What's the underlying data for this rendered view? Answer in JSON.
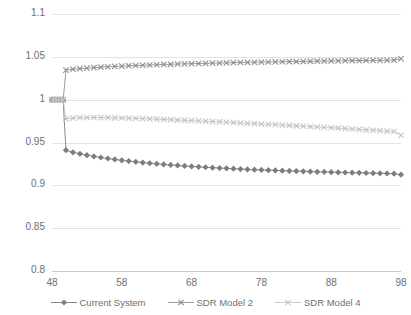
{
  "chart_data": {
    "type": "line",
    "title": "",
    "subtitle": "",
    "xlabel": "",
    "ylabel": "",
    "xlim": [
      48,
      98
    ],
    "ylim": [
      0.8,
      1.1
    ],
    "xticks": [
      48,
      58,
      68,
      78,
      88,
      98
    ],
    "yticks": [
      0.8,
      0.85,
      0.9,
      0.95,
      1,
      1.05,
      1.1
    ],
    "ytick_labels": [
      "0.8",
      "0.85",
      "0.9",
      "0.95",
      "1",
      "1.05",
      "1.1"
    ],
    "xtick_labels": [
      "48",
      "58",
      "68",
      "78",
      "88",
      "98"
    ],
    "grid": "horizontal",
    "legend_position": "bottom",
    "x": [
      48,
      48.4,
      48.8,
      49.2,
      49.6,
      50,
      51,
      52,
      53,
      54,
      55,
      56,
      57,
      58,
      59,
      60,
      61,
      62,
      63,
      64,
      65,
      66,
      67,
      68,
      69,
      70,
      71,
      72,
      73,
      74,
      75,
      76,
      77,
      78,
      79,
      80,
      81,
      82,
      83,
      84,
      85,
      86,
      87,
      88,
      89,
      90,
      91,
      92,
      93,
      94,
      95,
      96,
      97,
      98
    ],
    "series": [
      {
        "name": "Current System",
        "marker": "diamond",
        "color": "#7d7d7d",
        "values": [
          1.0,
          1.0,
          1.0,
          1.0,
          0.999,
          0.941,
          0.9385,
          0.9368,
          0.9352,
          0.9338,
          0.9325,
          0.9313,
          0.9302,
          0.9292,
          0.9283,
          0.9274,
          0.9266,
          0.9258,
          0.9251,
          0.9244,
          0.9238,
          0.9232,
          0.9226,
          0.9221,
          0.9216,
          0.9211,
          0.9206,
          0.9202,
          0.9198,
          0.9194,
          0.919,
          0.9186,
          0.9183,
          0.918,
          0.9177,
          0.9174,
          0.9171,
          0.9168,
          0.9166,
          0.9163,
          0.9161,
          0.9158,
          0.9156,
          0.9154,
          0.9152,
          0.915,
          0.9148,
          0.9146,
          0.9144,
          0.9142,
          0.914,
          0.9138,
          0.9136,
          0.9125
        ]
      },
      {
        "name": "SDR Model 2",
        "marker": "x",
        "color": "#8f8f8f",
        "values": [
          1.0,
          1.0,
          1.0,
          1.0,
          1.0,
          1.0345,
          1.0355,
          1.0362,
          1.0368,
          1.0374,
          1.0379,
          1.0384,
          1.0388,
          1.0392,
          1.0396,
          1.0399,
          1.0402,
          1.0405,
          1.0408,
          1.0411,
          1.0413,
          1.0416,
          1.0418,
          1.042,
          1.0422,
          1.0424,
          1.0426,
          1.0428,
          1.043,
          1.0432,
          1.0434,
          1.0435,
          1.0437,
          1.0438,
          1.044,
          1.0441,
          1.0443,
          1.0444,
          1.0445,
          1.0447,
          1.0448,
          1.0449,
          1.045,
          1.0452,
          1.0453,
          1.0454,
          1.0455,
          1.0456,
          1.0457,
          1.0458,
          1.0459,
          1.046,
          1.0461,
          1.0478
        ]
      },
      {
        "name": "SDR Model 4",
        "marker": "x",
        "color": "#c4c4c4",
        "values": [
          1.0,
          1.0,
          1.0,
          1.0,
          1.0,
          0.9775,
          0.9785,
          0.979,
          0.9792,
          0.9792,
          0.9791,
          0.979,
          0.9788,
          0.9786,
          0.9784,
          0.9781,
          0.9778,
          0.9775,
          0.9772,
          0.9769,
          0.9766,
          0.9762,
          0.9759,
          0.9755,
          0.9752,
          0.9748,
          0.9744,
          0.974,
          0.9736,
          0.9732,
          0.9728,
          0.9724,
          0.972,
          0.9716,
          0.9712,
          0.9708,
          0.9703,
          0.9699,
          0.9695,
          0.969,
          0.9686,
          0.9681,
          0.9677,
          0.9672,
          0.9667,
          0.9663,
          0.9658,
          0.9653,
          0.9648,
          0.9643,
          0.9638,
          0.9633,
          0.9628,
          0.9585
        ]
      }
    ],
    "legend": [
      "Current System",
      "SDR Model 2",
      "SDR Model 4"
    ]
  },
  "colors": {
    "gridline": "#e2e2e2",
    "axis": "#c9c9c9",
    "tick_text": "#6f6f6f",
    "series_current_system": "#7d7d7d",
    "series_sdr_model_2": "#8f8f8f",
    "series_sdr_model_4": "#c4c4c4"
  }
}
